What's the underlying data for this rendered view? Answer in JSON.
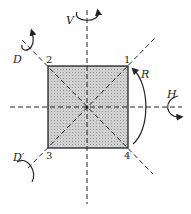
{
  "diagram": {
    "vertices": [
      "1",
      "2",
      "3",
      "4"
    ],
    "axes": {
      "vertical": "V",
      "horizontal": "H",
      "diagonal": "D",
      "diagonal_prime": "D′",
      "rotation": "R"
    },
    "colors": {
      "fill": "#c4c4c4",
      "stroke": "#222222"
    }
  }
}
